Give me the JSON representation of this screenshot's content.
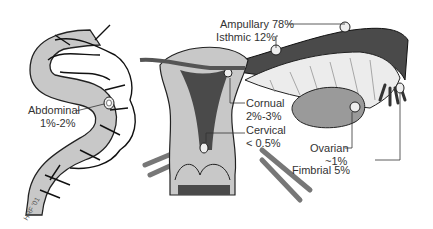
{
  "diagram": {
    "labels": {
      "ampullary": "Ampullary 78%",
      "isthmic": "Isthmic 12%",
      "abdominal_name": "Abdominal",
      "abdominal_pct": "1%-2%",
      "cornual_name": "Cornual",
      "cornual_pct": "2%-3%",
      "cervical_name": "Cervical",
      "cervical_pct": "< 0.5%",
      "ovarian_name": "Ovarian",
      "ovarian_pct": "~1%",
      "fimbrial": "Fimbrial 5%"
    },
    "signature": "HRF '01",
    "colors": {
      "tissue": "#c8c8c8",
      "dark_lumen": "#4a4a4a",
      "line": "#1a1a1a",
      "tube_light": "#e6e6e6"
    }
  }
}
